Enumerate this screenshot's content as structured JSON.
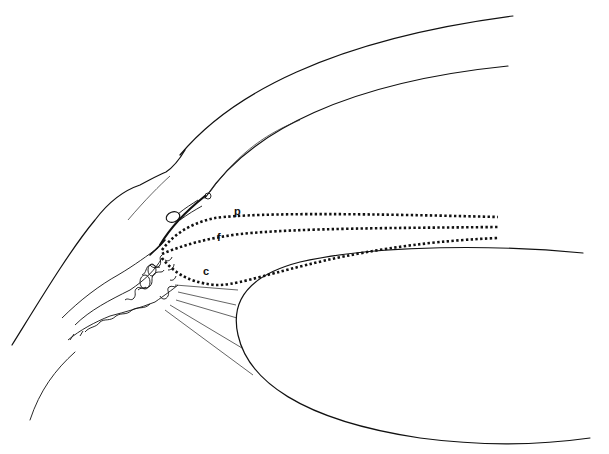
{
  "figure": {
    "type": "anatomical line drawing",
    "background": "#ffffff",
    "ink": "#111111"
  },
  "labels": [
    {
      "id": "p",
      "text": "p",
      "x": 234,
      "y": 215
    },
    {
      "id": "f",
      "text": "f",
      "x": 217,
      "y": 240
    },
    {
      "id": "c",
      "text": "c",
      "x": 204,
      "y": 275
    }
  ],
  "dotted_paths": [
    {
      "label": "p",
      "description": "upper dotted path"
    },
    {
      "label": "f",
      "description": "middle dotted path"
    },
    {
      "label": "c",
      "description": "lower dotted path"
    }
  ]
}
